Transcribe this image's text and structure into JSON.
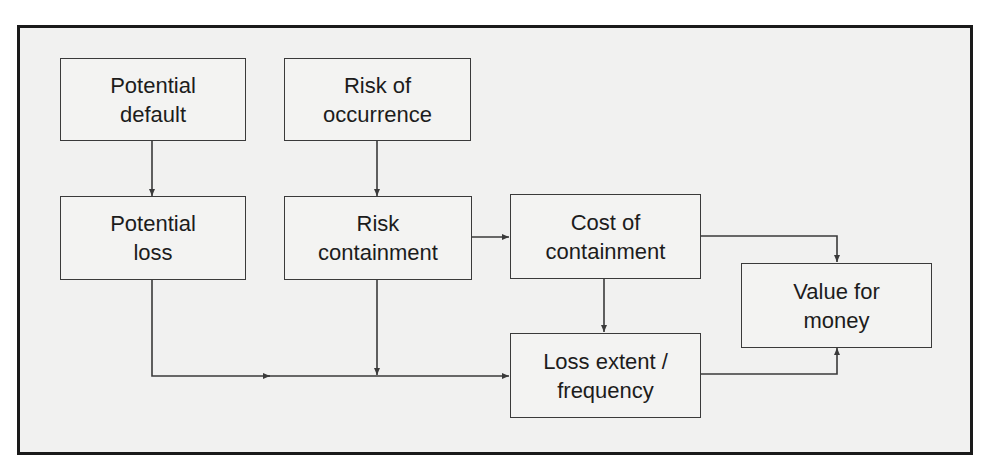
{
  "diagram": {
    "type": "flowchart",
    "nodes": [
      {
        "id": "potential_default",
        "lines": [
          "Potential",
          "default"
        ]
      },
      {
        "id": "risk_of_occurrence",
        "lines": [
          "Risk of",
          "occurrence"
        ]
      },
      {
        "id": "potential_loss",
        "lines": [
          "Potential",
          "loss"
        ]
      },
      {
        "id": "risk_containment",
        "lines": [
          "Risk",
          "containment"
        ]
      },
      {
        "id": "cost_of_containment",
        "lines": [
          "Cost of",
          "containment"
        ]
      },
      {
        "id": "loss_extent_frequency",
        "lines": [
          "Loss extent /",
          "frequency"
        ]
      },
      {
        "id": "value_for_money",
        "lines": [
          "Value for",
          "money"
        ]
      }
    ],
    "edges": [
      {
        "from": "potential_default",
        "to": "potential_loss"
      },
      {
        "from": "risk_of_occurrence",
        "to": "risk_containment"
      },
      {
        "from": "risk_containment",
        "to": "cost_of_containment"
      },
      {
        "from": "potential_loss",
        "to": "loss_extent_frequency"
      },
      {
        "from": "risk_containment",
        "to": "loss_extent_frequency"
      },
      {
        "from": "cost_of_containment",
        "to": "loss_extent_frequency"
      },
      {
        "from": "cost_of_containment",
        "to": "value_for_money"
      },
      {
        "from": "loss_extent_frequency",
        "to": "value_for_money"
      }
    ],
    "colors": {
      "line": "#3a3a3a",
      "frame": "#1a1a1a",
      "background": "#f1f1f0",
      "text": "#1c1c1c"
    }
  }
}
